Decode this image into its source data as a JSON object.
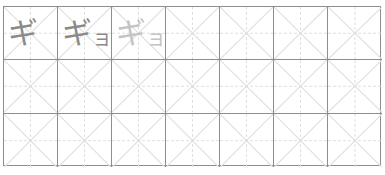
{
  "worksheet": {
    "columns": 7,
    "rows": 3,
    "colors": {
      "cell_border": "#8e8e8e",
      "guide_line": "#e0e0e0",
      "sample_text": "#8a8a8a",
      "trace_text": "#c4c4c4"
    },
    "samples": [
      {
        "row": 0,
        "col": 0,
        "main": "ギ",
        "small": "",
        "style": "dark"
      },
      {
        "row": 0,
        "col": 1,
        "main": "ギ",
        "small": "ョ",
        "style": "dark"
      },
      {
        "row": 0,
        "col": 2,
        "main": "ギ",
        "small": "ョ",
        "style": "light"
      }
    ]
  }
}
